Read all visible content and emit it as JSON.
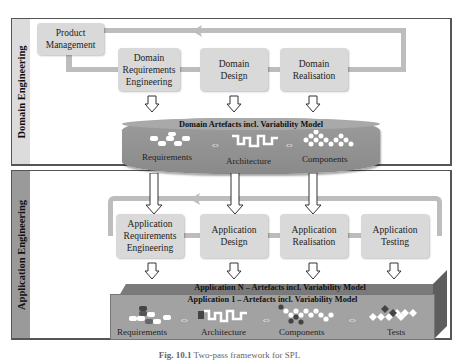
{
  "diagram": {
    "domain_engineering": {
      "side_label": "Domain Engineering",
      "boxes": [
        {
          "id": "product-management",
          "label": "Product\nManagement"
        },
        {
          "id": "domain-requirements-engineering",
          "label": "Domain\nRequirements\nEngineering"
        },
        {
          "id": "domain-design",
          "label": "Domain\nDesign"
        },
        {
          "id": "domain-realisation",
          "label": "Domain\nRealisation"
        }
      ],
      "artefacts": {
        "title": "Domain Artefacts incl. Variability Model",
        "items": [
          "Requirements",
          "Architecture",
          "Components"
        ]
      }
    },
    "application_engineering": {
      "side_label": "Application Engineering",
      "boxes": [
        {
          "id": "application-requirements-engineering",
          "label": "Application\nRequirements\nEngineering"
        },
        {
          "id": "application-design",
          "label": "Application\nDesign"
        },
        {
          "id": "application-realisation",
          "label": "Application\nRealisation"
        },
        {
          "id": "application-testing",
          "label": "Application\nTesting"
        }
      ],
      "artefacts_n": {
        "title": "Application N – Artefacts incl. Variability Model"
      },
      "artefacts_1": {
        "title": "Application 1 – Artefacts incl. Variability Model",
        "items": [
          "Requirements",
          "Architecture",
          "Components",
          "Tests"
        ]
      }
    },
    "caption": {
      "figure": "Fig. 10.1",
      "text": "Two-pass framework for SPL"
    },
    "colors": {
      "box_fill": "#d9d9d9",
      "loop_line": "#bdbdbd",
      "domain_side": "#dcdcdc",
      "application_side": "#9a9a9a",
      "disk_fill": "#9c9c9c",
      "bar_front": "#a2a2a2",
      "bar_back": "#7a7a7a"
    }
  }
}
